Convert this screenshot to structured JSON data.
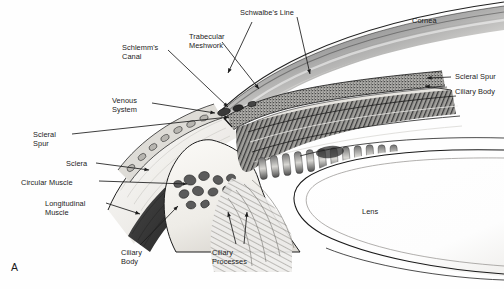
{
  "figure": {
    "panel_label": "A",
    "background_color": "#fefefe",
    "ink_color": "#1b1b1b"
  },
  "labels": [
    {
      "id": "schlemms-canal",
      "text": "Schlemm's\nCanal",
      "x": 122,
      "y": 44,
      "align": "left"
    },
    {
      "id": "venous-system",
      "text": "Venous\nSystem",
      "x": 112,
      "y": 97,
      "align": "left"
    },
    {
      "id": "scleral-spur-left",
      "text": "Scleral\nSpur",
      "x": 33,
      "y": 131,
      "align": "left"
    },
    {
      "id": "sclera",
      "text": "Sclera",
      "x": 66,
      "y": 160,
      "align": "left"
    },
    {
      "id": "circular-muscle",
      "text": "Circular Muscle",
      "x": 21,
      "y": 179,
      "align": "left"
    },
    {
      "id": "longitudinal-muscle",
      "text": "Longitudinal\nMuscle",
      "x": 45,
      "y": 200,
      "align": "left"
    },
    {
      "id": "ciliary-body-left",
      "text": "Ciliary\nBody",
      "x": 121,
      "y": 249,
      "align": "left"
    },
    {
      "id": "ciliary-processes",
      "text": "Ciliary\nProcesses",
      "x": 212,
      "y": 249,
      "align": "left"
    },
    {
      "id": "trabecular-meshwork",
      "text": "Trabecular\nMeshwork",
      "x": 189,
      "y": 33,
      "align": "left"
    },
    {
      "id": "schwalbes-line",
      "text": "Schwalbe's Line",
      "x": 240,
      "y": 9,
      "align": "left"
    },
    {
      "id": "cornea",
      "text": "Cornea",
      "x": 412,
      "y": 17,
      "align": "left"
    },
    {
      "id": "scleral-spur-right",
      "text": "Scleral Spur",
      "x": 455,
      "y": 73,
      "align": "left"
    },
    {
      "id": "ciliary-body-right",
      "text": "Ciliary Body",
      "x": 455,
      "y": 88,
      "align": "left"
    },
    {
      "id": "lens",
      "text": "Lens",
      "x": 362,
      "y": 208,
      "align": "left"
    }
  ],
  "leader_lines": [
    {
      "id": "leader-schlemms-canal",
      "from": [
        168,
        50
      ],
      "to": [
        228,
        107
      ]
    },
    {
      "id": "leader-venous-system",
      "from": [
        152,
        103
      ],
      "to": [
        215,
        113
      ]
    },
    {
      "id": "leader-scleral-spur-left",
      "from": [
        72,
        134
      ],
      "to": [
        229,
        117
      ]
    },
    {
      "id": "leader-sclera",
      "from": [
        96,
        163
      ],
      "to": [
        149,
        170
      ]
    },
    {
      "id": "leader-circular-muscle",
      "from": [
        99,
        181
      ],
      "to": [
        187,
        184
      ]
    },
    {
      "id": "leader-longitudinal-muscle",
      "from": [
        106,
        203
      ],
      "to": [
        140,
        214
      ]
    },
    {
      "id": "leader-ciliary-body-left",
      "from": [
        140,
        245
      ],
      "to": [
        178,
        206
      ]
    },
    {
      "id": "leader-ciliary-processes-a",
      "from": [
        236,
        244
      ],
      "to": [
        228,
        212
      ]
    },
    {
      "id": "leader-ciliary-processes-b",
      "from": [
        244,
        244
      ],
      "to": [
        247,
        212
      ]
    },
    {
      "id": "leader-trabecular-meshwork",
      "from": [
        222,
        42
      ],
      "to": [
        259,
        89
      ]
    },
    {
      "id": "leader-schwalbes-line",
      "from": [
        252,
        22
      ],
      "to": [
        228,
        73
      ]
    },
    {
      "id": "leader-schwalbes-line-2",
      "from": [
        297,
        17
      ],
      "to": [
        310,
        74
      ]
    },
    {
      "id": "leader-scleral-spur-right",
      "from": [
        451,
        77
      ],
      "to": [
        427,
        78
      ]
    },
    {
      "id": "leader-ciliary-body-right",
      "from": [
        451,
        90
      ],
      "to": [
        425,
        86
      ]
    }
  ],
  "structures": [
    {
      "id": "cornea",
      "tone": "#ffffff"
    },
    {
      "id": "sclera",
      "tone": "#f2f1ef"
    },
    {
      "id": "trabecular-meshwork",
      "tone": "#5a5a5a"
    },
    {
      "id": "schlemms-canal",
      "tone": "#2e2e2e"
    },
    {
      "id": "venous-system",
      "tone": "#cfcdc8"
    },
    {
      "id": "ciliary-body",
      "tone": "#efeee9"
    },
    {
      "id": "circular-muscle",
      "tone": "#4a4a4a"
    },
    {
      "id": "longitudinal-muscle",
      "tone": "#3a3a3a"
    },
    {
      "id": "ciliary-processes",
      "tone": "#8d8d8d"
    },
    {
      "id": "lens",
      "tone": "#fdfdfd"
    },
    {
      "id": "zonules",
      "tone": "#b9b7b2"
    }
  ]
}
